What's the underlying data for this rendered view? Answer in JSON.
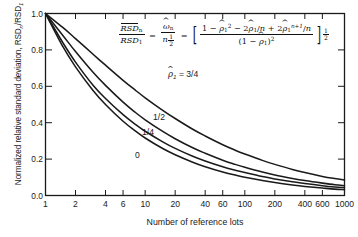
{
  "chart_data": {
    "type": "line",
    "title": "",
    "xlabel": "Number of reference lots",
    "ylabel": "Normalized relative standard deviation, RSD_n/RSD_1",
    "xscale": "log",
    "xlim": [
      1,
      1000
    ],
    "ylim": [
      0.0,
      1.0
    ],
    "grid": false,
    "legend": "inline-curve-labels",
    "xticks": [
      1,
      2,
      4,
      6,
      10,
      20,
      40,
      60,
      100,
      200,
      400,
      600,
      1000
    ],
    "xtick_labels": [
      "1",
      "2",
      "4",
      "6",
      "10",
      "20",
      "40",
      "60",
      "100",
      "200",
      "400",
      "600",
      "1000"
    ],
    "yticks": [
      0.0,
      0.2,
      0.4,
      0.6,
      0.8,
      1.0
    ],
    "ytick_labels": [
      "0.0",
      "0.2",
      "0.4",
      "0.6",
      "0.8",
      "1.0"
    ],
    "x": [
      1,
      1.5,
      2,
      3,
      4,
      6,
      8,
      10,
      15,
      20,
      30,
      40,
      60,
      80,
      100,
      150,
      200,
      300,
      400,
      600,
      800,
      1000
    ],
    "series": [
      {
        "name": "rho_hat_1 = 3/4",
        "label": "3/4",
        "rho": 0.75,
        "values": [
          1.0,
          0.922,
          0.862,
          0.776,
          0.716,
          0.633,
          0.578,
          0.537,
          0.468,
          0.423,
          0.364,
          0.327,
          0.279,
          0.249,
          0.228,
          0.193,
          0.171,
          0.143,
          0.126,
          0.105,
          0.093,
          0.085
        ]
      },
      {
        "name": "rho_hat_1 = 1/2",
        "label": "1/2",
        "rho": 0.5,
        "values": [
          1.0,
          0.878,
          0.791,
          0.677,
          0.605,
          0.513,
          0.456,
          0.416,
          0.352,
          0.312,
          0.262,
          0.232,
          0.194,
          0.171,
          0.155,
          0.129,
          0.113,
          0.094,
          0.082,
          0.068,
          0.059,
          0.054
        ]
      },
      {
        "name": "rho_hat_1 = 1/4",
        "label": "1/4",
        "rho": 0.25,
        "values": [
          1.0,
          0.838,
          0.733,
          0.606,
          0.533,
          0.444,
          0.39,
          0.353,
          0.295,
          0.259,
          0.216,
          0.19,
          0.158,
          0.139,
          0.126,
          0.104,
          0.091,
          0.075,
          0.066,
          0.054,
          0.047,
          0.043
        ]
      },
      {
        "name": "rho_hat_1 = 0",
        "label": "0",
        "rho": 0.0,
        "values": [
          1.0,
          0.816,
          0.707,
          0.577,
          0.5,
          0.408,
          0.354,
          0.316,
          0.258,
          0.224,
          0.183,
          0.158,
          0.129,
          0.112,
          0.1,
          0.082,
          0.071,
          0.058,
          0.05,
          0.041,
          0.035,
          0.032
        ]
      }
    ],
    "annotations": [
      {
        "id": "label-34",
        "text": "= 3/4",
        "prefix": "rho-hat-1",
        "x_px": 178,
        "y_px": 74
      },
      {
        "id": "label-12",
        "text": "1/2",
        "x_px": 160,
        "y_px": 117
      },
      {
        "id": "label-14",
        "text": "1/4",
        "x_px": 149,
        "y_px": 132
      },
      {
        "id": "label-0",
        "text": "0",
        "x_px": 139,
        "y_px": 155
      }
    ],
    "equation": {
      "lhs_num": "RSD_n",
      "lhs_den": "RSD_1",
      "mid_num": "omega_hat_n",
      "mid_den": "n^(1/2)",
      "rhs_num": "1 - rho_hat_1^2 - 2 rho_hat_1/n + 2 rho_hat_1^(n+1)/n",
      "rhs_den": "(1 - rho_hat_1)^2",
      "rhs_exponent": "1/2"
    },
    "colors": {
      "background": "#ffffff",
      "axis": "#1a1a1a",
      "curve": "#1a1a1a",
      "text": "#1a1a1a"
    }
  },
  "axis": {
    "xlabel": "Number of reference lots",
    "ylabel": "Normalized relative standard deviation, RSD",
    "ylabel_sub_n": "n",
    "ylabel_sub_1": "1"
  },
  "labels": {
    "rho_eq_34": "= 3/4",
    "half": "1/2",
    "quarter": "1/4",
    "zero": "0"
  }
}
